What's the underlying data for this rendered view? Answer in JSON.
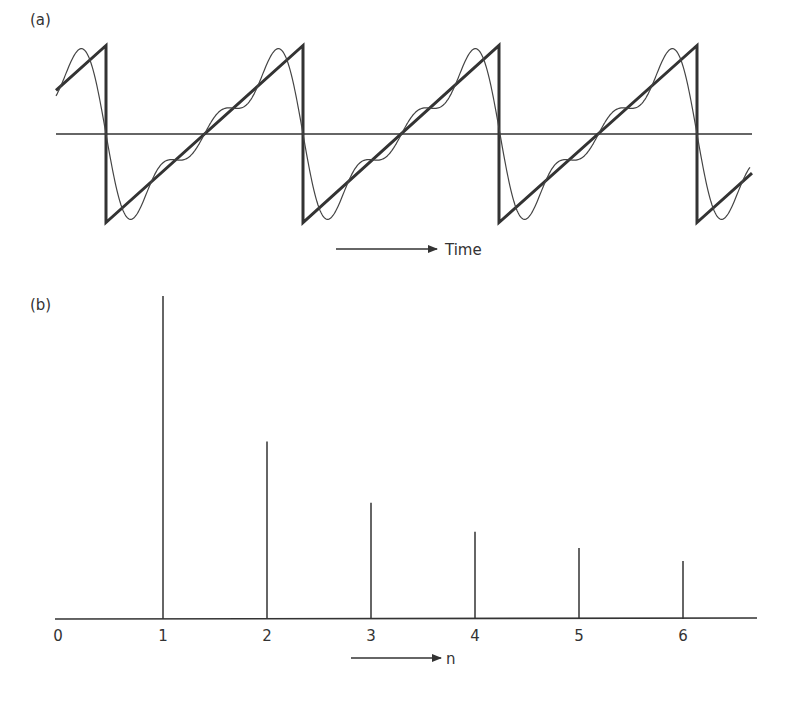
{
  "panel_a": {
    "label": "(a)",
    "axis_label": "Time",
    "description": "Sawtooth wave (thick) with partial Fourier series approximation (thin, first three harmonics)",
    "period_px": 197,
    "jump_x": [
      106,
      303,
      499,
      697
    ],
    "peak_y": 46,
    "trough_y": 223,
    "axis_y": 134,
    "x_start": 56,
    "x_end": 752,
    "stroke_color": "#333333"
  },
  "panel_b": {
    "label": "(b)",
    "axis_label": "n",
    "tick_labels": [
      "0",
      "1",
      "2",
      "3",
      "4",
      "5",
      "6"
    ]
  },
  "chart_data": [
    {
      "type": "line",
      "title": "(a)",
      "xlabel": "Time",
      "ylabel": "",
      "series": [
        {
          "name": "Sawtooth wave",
          "shape": "sawtooth",
          "amplitude": 1,
          "periods_shown": 3.5
        },
        {
          "name": "Fourier approximation (3 harmonics)",
          "shape": "sum of sin(n t)/n, n=1..3"
        }
      ],
      "grid": false
    },
    {
      "type": "bar",
      "title": "(b)",
      "xlabel": "n",
      "ylabel": "Amplitude",
      "categories": [
        "1",
        "2",
        "3",
        "4",
        "5",
        "6"
      ],
      "x_ticks": [
        0,
        1,
        2,
        3,
        4,
        5,
        6
      ],
      "values": [
        1.0,
        0.55,
        0.36,
        0.27,
        0.22,
        0.18
      ],
      "note": "Line spectrum, amplitudes approx 1/n",
      "grid": false
    }
  ]
}
